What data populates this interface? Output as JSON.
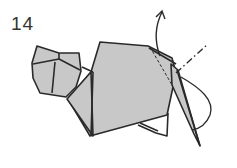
{
  "diagram": {
    "step_number": "14",
    "colors": {
      "paper_fill": "#c8c8c8",
      "line": "#2a2a2a",
      "background": "#ffffff"
    },
    "annotations": [
      {
        "type": "arrow",
        "direction": "up",
        "meaning": "fold flap upward"
      },
      {
        "type": "dash-dot line",
        "meaning": "mountain/valley fold line"
      },
      {
        "type": "dashed line",
        "meaning": "hidden edge / fold reference"
      },
      {
        "type": "curved arrow loop",
        "meaning": "fold motion path"
      }
    ]
  }
}
